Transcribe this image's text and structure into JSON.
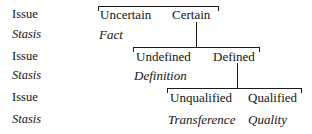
{
  "diagram": {
    "line_color": "#1a1a1a",
    "text_color": "#141414",
    "background": "#ffffff",
    "row_labels": [
      {
        "text": "Issue",
        "style": "roman",
        "y": 8
      },
      {
        "text": "Stasis",
        "style": "italic",
        "y": 28
      },
      {
        "text": "Issue",
        "style": "roman",
        "y": 50
      },
      {
        "text": "Stasis",
        "style": "italic",
        "y": 69
      },
      {
        "text": "Issue",
        "style": "roman",
        "y": 91
      },
      {
        "text": "Stasis",
        "style": "italic",
        "y": 113
      }
    ],
    "levels": [
      {
        "name": "level-1",
        "issue_terms": [
          {
            "text": "Uncertain",
            "x": 100,
            "y": 8
          },
          {
            "text": "Certain",
            "x": 172,
            "y": 8
          }
        ],
        "stasis_terms": [
          {
            "text": "Fact",
            "x": 99,
            "y": 28
          }
        ],
        "bracket": {
          "x": 98,
          "y": 6,
          "width": 121
        },
        "connector": {
          "x": 196,
          "y": 22,
          "height": 25
        }
      },
      {
        "name": "level-2",
        "issue_terms": [
          {
            "text": "Undefined",
            "x": 136,
            "y": 50
          },
          {
            "text": "Defined",
            "x": 213,
            "y": 50
          }
        ],
        "stasis_terms": [
          {
            "text": "Definition",
            "x": 134,
            "y": 69
          }
        ],
        "bracket": {
          "x": 133,
          "y": 47,
          "width": 127
        },
        "connector": {
          "x": 237,
          "y": 63,
          "height": 25
        }
      },
      {
        "name": "level-3",
        "issue_terms": [
          {
            "text": "Unqualified",
            "x": 170,
            "y": 91
          },
          {
            "text": "Qualified",
            "x": 248,
            "y": 91
          }
        ],
        "stasis_terms": [
          {
            "text": "Transference",
            "x": 168,
            "y": 113
          },
          {
            "text": "Quality",
            "x": 248,
            "y": 113
          }
        ],
        "bracket": {
          "x": 167,
          "y": 88,
          "width": 135
        },
        "connector": null
      }
    ]
  }
}
